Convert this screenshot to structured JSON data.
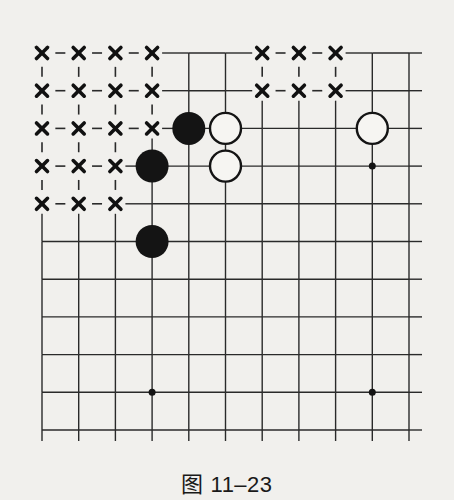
{
  "figure": {
    "caption": "图 11–23",
    "type": "go-board-corner-diagram",
    "board": {
      "columns": 11,
      "rows": 11,
      "top_edge": true,
      "left_edge": true
    },
    "colors": {
      "background": "#f1f0ed",
      "line": "#2a2a2a",
      "black_stone": "#141414",
      "white_stone_fill": "#f6f5f2",
      "mark": "#111111"
    },
    "stones": [
      {
        "color": "black",
        "col": 4,
        "row": 2
      },
      {
        "color": "black",
        "col": 3,
        "row": 3
      },
      {
        "color": "black",
        "col": 3,
        "row": 5
      },
      {
        "color": "white",
        "col": 5,
        "row": 2
      },
      {
        "color": "white",
        "col": 5,
        "row": 3
      },
      {
        "color": "white",
        "col": 9,
        "row": 2
      }
    ],
    "star_points": [
      {
        "col": 9,
        "row": 3
      },
      {
        "col": 3,
        "row": 9
      },
      {
        "col": 9,
        "row": 9
      }
    ],
    "x_marks": [
      {
        "col": 0,
        "row": 0
      },
      {
        "col": 1,
        "row": 0
      },
      {
        "col": 2,
        "row": 0
      },
      {
        "col": 3,
        "row": 0
      },
      {
        "col": 6,
        "row": 0
      },
      {
        "col": 7,
        "row": 0
      },
      {
        "col": 8,
        "row": 0
      },
      {
        "col": 0,
        "row": 1
      },
      {
        "col": 1,
        "row": 1
      },
      {
        "col": 2,
        "row": 1
      },
      {
        "col": 3,
        "row": 1
      },
      {
        "col": 6,
        "row": 1
      },
      {
        "col": 7,
        "row": 1
      },
      {
        "col": 8,
        "row": 1
      },
      {
        "col": 0,
        "row": 2
      },
      {
        "col": 1,
        "row": 2
      },
      {
        "col": 2,
        "row": 2
      },
      {
        "col": 3,
        "row": 2
      },
      {
        "col": 0,
        "row": 3
      },
      {
        "col": 1,
        "row": 3
      },
      {
        "col": 2,
        "row": 3
      },
      {
        "col": 0,
        "row": 4
      },
      {
        "col": 1,
        "row": 4
      },
      {
        "col": 2,
        "row": 4
      }
    ],
    "x_mark_symbol": "×"
  }
}
